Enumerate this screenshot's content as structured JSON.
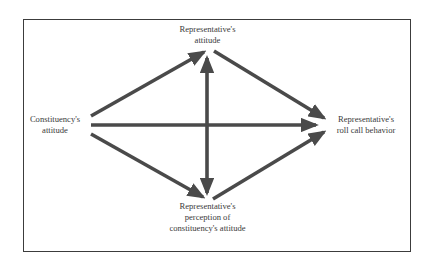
{
  "diagram": {
    "type": "causal-path-diagram",
    "nodes": {
      "rep_attitude": {
        "lines": [
          "Representative's",
          "attitude"
        ]
      },
      "constituency": {
        "lines": [
          "Constituency's",
          "attitude"
        ]
      },
      "roll_call": {
        "lines": [
          "Representative's",
          "roll call behavior"
        ]
      },
      "perception": {
        "lines": [
          "Representative's",
          "perception of",
          "constituency's attitude"
        ]
      }
    },
    "edges": [
      {
        "from": "constituency",
        "to": "rep_attitude",
        "direction": "forward"
      },
      {
        "from": "constituency",
        "to": "roll_call",
        "direction": "forward"
      },
      {
        "from": "constituency",
        "to": "perception",
        "direction": "forward"
      },
      {
        "from": "rep_attitude",
        "to": "roll_call",
        "direction": "forward"
      },
      {
        "from": "perception",
        "to": "roll_call",
        "direction": "forward"
      },
      {
        "from": "rep_attitude",
        "to": "perception",
        "direction": "bidirectional"
      }
    ],
    "colors": {
      "arrow": "#4a4a4a",
      "border": "#3c3c3c",
      "text": "#3a3a3a",
      "background": "#ffffff"
    }
  }
}
